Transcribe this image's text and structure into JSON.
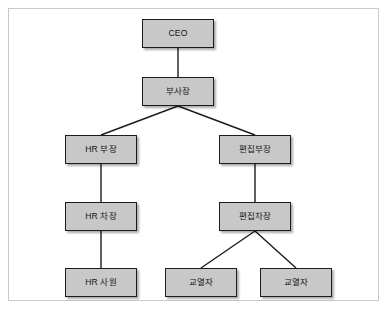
{
  "diagram": {
    "type": "organization-chart",
    "title": "",
    "frame": {
      "border_color": "#c9c9c9",
      "background": "#ffffff"
    },
    "style": {
      "node_fill": "#c8c8c8",
      "node_border": "#1c1c1c",
      "connector_color": "#1c1c1c",
      "text_color": "#141414"
    },
    "nodes": [
      {
        "id": "ceo",
        "label": "CEO",
        "level": 0,
        "x": 133,
        "y": 10,
        "w": 72,
        "h": 29
      },
      {
        "id": "vp",
        "label": "부사장",
        "level": 1,
        "x": 133,
        "y": 68,
        "w": 72,
        "h": 29
      },
      {
        "id": "hr_bujang",
        "label": "HR 부장",
        "level": 2,
        "x": 56,
        "y": 126,
        "w": 72,
        "h": 29
      },
      {
        "id": "ed_bujang",
        "label": "편집부장",
        "level": 2,
        "x": 210,
        "y": 126,
        "w": 72,
        "h": 29
      },
      {
        "id": "hr_chajang",
        "label": "HR 차장",
        "level": 3,
        "x": 56,
        "y": 193,
        "w": 72,
        "h": 29
      },
      {
        "id": "ed_chajang",
        "label": "편집차장",
        "level": 3,
        "x": 210,
        "y": 193,
        "w": 72,
        "h": 29
      },
      {
        "id": "hr_sawon",
        "label": "HR 사원",
        "level": 4,
        "x": 56,
        "y": 259,
        "w": 72,
        "h": 29
      },
      {
        "id": "proof_1",
        "label": "교열자",
        "level": 4,
        "x": 156,
        "y": 259,
        "w": 72,
        "h": 29
      },
      {
        "id": "proof_2",
        "label": "교열자",
        "level": 4,
        "x": 251,
        "y": 259,
        "w": 72,
        "h": 29
      }
    ],
    "edges": [
      {
        "from": "ceo",
        "to": "vp",
        "kind": "vertical"
      },
      {
        "from": "vp",
        "to": "hr_bujang",
        "kind": "diagonal"
      },
      {
        "from": "vp",
        "to": "ed_bujang",
        "kind": "diagonal"
      },
      {
        "from": "hr_bujang",
        "to": "hr_chajang",
        "kind": "vertical"
      },
      {
        "from": "hr_chajang",
        "to": "hr_sawon",
        "kind": "vertical"
      },
      {
        "from": "ed_bujang",
        "to": "ed_chajang",
        "kind": "vertical"
      },
      {
        "from": "ed_chajang",
        "to": "proof_1",
        "kind": "diagonal"
      },
      {
        "from": "ed_chajang",
        "to": "proof_2",
        "kind": "diagonal"
      }
    ]
  }
}
